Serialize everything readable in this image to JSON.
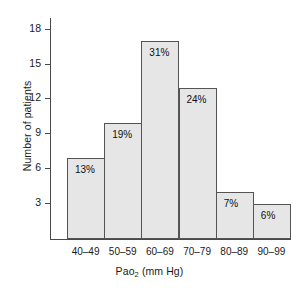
{
  "chart_data": {
    "type": "bar",
    "title": "",
    "xlabel": "Pao2 (mm Hg)",
    "xlabel_main": "Pao",
    "xlabel_sub": "2",
    "xlabel_rest": " (mm Hg)",
    "ylabel": "Number of patients",
    "categories": [
      "40–49",
      "50–59",
      "60–69",
      "70–79",
      "80–89",
      "90–99"
    ],
    "values": [
      7,
      10,
      17,
      13,
      4,
      3
    ],
    "data_labels": [
      "13%",
      "19%",
      "31%",
      "24%",
      "7%",
      "6%"
    ],
    "yticks": [
      3,
      6,
      9,
      12,
      15,
      18
    ],
    "ylim": [
      0,
      19
    ],
    "xlim_note": "categorical bins, contiguous bars",
    "grid": false,
    "legend": false,
    "bar_fill": "#e6e6e6",
    "bar_edge": "#545454",
    "axis_color": "#4a4a4a",
    "background": "#ffffff"
  }
}
